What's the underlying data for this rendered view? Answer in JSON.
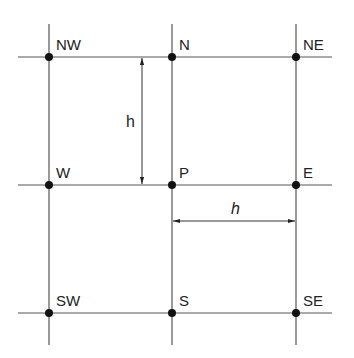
{
  "diagram": {
    "type": "finite-difference stencil grid",
    "nodes": {
      "nw": "NW",
      "n": "N",
      "ne": "NE",
      "w": "W",
      "p": "P",
      "e": "E",
      "sw": "SW",
      "s": "S",
      "se": "SE"
    },
    "dimensions": {
      "vertical_spacing": "h",
      "horizontal_spacing": "h"
    },
    "colors": {
      "lines": "#555555",
      "nodes": "#111111",
      "text": "#222222"
    }
  }
}
